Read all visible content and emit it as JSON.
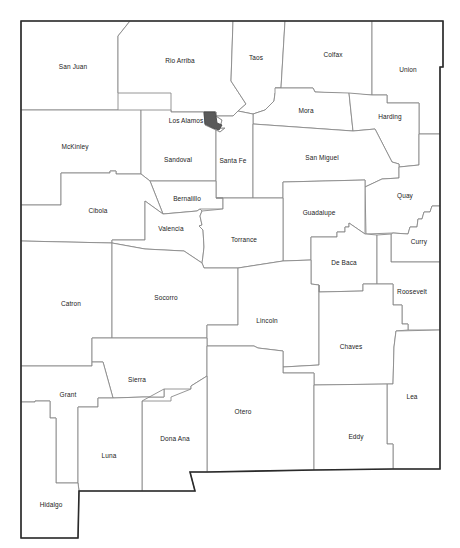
{
  "map": {
    "title": "New Mexico Counties",
    "highlight_color": "#5a5a5a",
    "border_color": "#2a2a2a",
    "county_line_color": "#8a8a8a",
    "highlighted_county": "Los Alamos",
    "counties": [
      {
        "name": "San Juan",
        "label_x": 73,
        "label_y": 66
      },
      {
        "name": "Rio Arriba",
        "label_x": 180,
        "label_y": 60
      },
      {
        "name": "Taos",
        "label_x": 256,
        "label_y": 57
      },
      {
        "name": "Colfax",
        "label_x": 333,
        "label_y": 54
      },
      {
        "name": "Union",
        "label_x": 408,
        "label_y": 69
      },
      {
        "name": "Los Alamos",
        "label_x": 186,
        "label_y": 120
      },
      {
        "name": "Mora",
        "label_x": 306,
        "label_y": 110
      },
      {
        "name": "Harding",
        "label_x": 390,
        "label_y": 116
      },
      {
        "name": "McKinley",
        "label_x": 75,
        "label_y": 146
      },
      {
        "name": "Sandoval",
        "label_x": 178,
        "label_y": 159
      },
      {
        "name": "Santa Fe",
        "label_x": 233,
        "label_y": 160
      },
      {
        "name": "San Miguel",
        "label_x": 322,
        "label_y": 157
      },
      {
        "name": "Bernalillo",
        "label_x": 187,
        "label_y": 198
      },
      {
        "name": "Cibola",
        "label_x": 98,
        "label_y": 210
      },
      {
        "name": "Quay",
        "label_x": 405,
        "label_y": 195
      },
      {
        "name": "Guadalupe",
        "label_x": 319,
        "label_y": 212
      },
      {
        "name": "Valencia",
        "label_x": 171,
        "label_y": 228
      },
      {
        "name": "Torrance",
        "label_x": 244,
        "label_y": 239
      },
      {
        "name": "Curry",
        "label_x": 419,
        "label_y": 241
      },
      {
        "name": "De Baca",
        "label_x": 344,
        "label_y": 262
      },
      {
        "name": "Catron",
        "label_x": 71,
        "label_y": 303
      },
      {
        "name": "Socorro",
        "label_x": 166,
        "label_y": 297
      },
      {
        "name": "Roosevelt",
        "label_x": 412,
        "label_y": 291
      },
      {
        "name": "Lincoln",
        "label_x": 267,
        "label_y": 320
      },
      {
        "name": "Chaves",
        "label_x": 351,
        "label_y": 346
      },
      {
        "name": "Sierra",
        "label_x": 137,
        "label_y": 379
      },
      {
        "name": "Grant",
        "label_x": 68,
        "label_y": 394
      },
      {
        "name": "Lea",
        "label_x": 412,
        "label_y": 396
      },
      {
        "name": "Otero",
        "label_x": 243,
        "label_y": 411
      },
      {
        "name": "Dona Ana",
        "label_x": 175,
        "label_y": 438
      },
      {
        "name": "Eddy",
        "label_x": 356,
        "label_y": 436
      },
      {
        "name": "Luna",
        "label_x": 109,
        "label_y": 455
      },
      {
        "name": "Hidalgo",
        "label_x": 51,
        "label_y": 504
      }
    ]
  }
}
